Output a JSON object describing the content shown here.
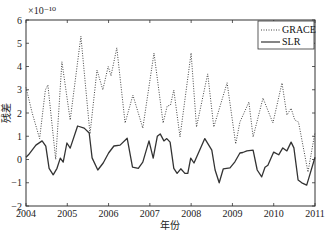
{
  "chart_data": {
    "type": "line",
    "title": "",
    "xlabel": "年份",
    "ylabel": "残差",
    "y_multiplier": "×10⁻¹⁰",
    "xlim": [
      2004,
      2011
    ],
    "ylim": [
      -2,
      6
    ],
    "x_ticks": [
      "2004",
      "2005",
      "2006",
      "2007",
      "2008",
      "2009",
      "2010",
      "2011"
    ],
    "y_ticks": [
      "-2",
      "-1",
      "0",
      "1",
      "2",
      "3",
      "4",
      "5",
      "6"
    ],
    "grid": false,
    "legend_position": "upper right",
    "series": [
      {
        "name": "GRACE",
        "style": "dotted",
        "color": "#444444",
        "points": [
          [
            2004.0,
            3.1
          ],
          [
            2004.15,
            2.0
          ],
          [
            2004.33,
            0.9
          ],
          [
            2004.47,
            3.0
          ],
          [
            2004.53,
            3.2
          ],
          [
            2004.72,
            0.0
          ],
          [
            2004.87,
            4.2
          ],
          [
            2005.07,
            1.7
          ],
          [
            2005.33,
            5.3
          ],
          [
            2005.55,
            1.1
          ],
          [
            2005.72,
            3.85
          ],
          [
            2005.86,
            3.0
          ],
          [
            2005.99,
            4.0
          ],
          [
            2006.06,
            3.6
          ],
          [
            2006.2,
            4.8
          ],
          [
            2006.4,
            1.57
          ],
          [
            2006.59,
            2.77
          ],
          [
            2006.83,
            1.35
          ],
          [
            2007.1,
            4.58
          ],
          [
            2007.32,
            1.57
          ],
          [
            2007.42,
            2.3
          ],
          [
            2007.5,
            2.34
          ],
          [
            2007.58,
            2.99
          ],
          [
            2007.73,
            0.97
          ],
          [
            2008.0,
            4.58
          ],
          [
            2008.13,
            1.4
          ],
          [
            2008.4,
            3.68
          ],
          [
            2008.55,
            1.4
          ],
          [
            2008.87,
            3.3
          ],
          [
            2009.08,
            0.67
          ],
          [
            2009.18,
            1.61
          ],
          [
            2009.4,
            2.47
          ],
          [
            2009.5,
            0.97
          ],
          [
            2009.74,
            2.64
          ],
          [
            2009.98,
            1.57
          ],
          [
            2010.2,
            3.29
          ],
          [
            2010.32,
            1.91
          ],
          [
            2010.42,
            2.2
          ],
          [
            2010.51,
            1.7
          ],
          [
            2010.6,
            1.61
          ],
          [
            2010.83,
            -0.54
          ],
          [
            2011.0,
            1.18
          ]
        ]
      },
      {
        "name": "SLR",
        "style": "solid",
        "color": "#333333",
        "points": [
          [
            2004.0,
            0.1
          ],
          [
            2004.06,
            0.2
          ],
          [
            2004.24,
            0.62
          ],
          [
            2004.39,
            0.8
          ],
          [
            2004.48,
            0.57
          ],
          [
            2004.56,
            -0.38
          ],
          [
            2004.66,
            -0.66
          ],
          [
            2004.75,
            -0.38
          ],
          [
            2004.83,
            0.06
          ],
          [
            2004.9,
            -0.11
          ],
          [
            2004.99,
            0.71
          ],
          [
            2005.07,
            0.49
          ],
          [
            2005.25,
            1.44
          ],
          [
            2005.41,
            1.35
          ],
          [
            2005.53,
            1.14
          ],
          [
            2005.6,
            0.07
          ],
          [
            2005.74,
            -0.45
          ],
          [
            2005.87,
            -0.15
          ],
          [
            2006.0,
            0.28
          ],
          [
            2006.13,
            0.58
          ],
          [
            2006.28,
            0.62
          ],
          [
            2006.45,
            0.91
          ],
          [
            2006.58,
            -0.33
          ],
          [
            2006.72,
            -0.38
          ],
          [
            2006.83,
            -0.11
          ],
          [
            2006.98,
            0.8
          ],
          [
            2007.08,
            0.06
          ],
          [
            2007.18,
            1.0
          ],
          [
            2007.25,
            1.1
          ],
          [
            2007.34,
            0.8
          ],
          [
            2007.41,
            0.9
          ],
          [
            2007.49,
            0.75
          ],
          [
            2007.58,
            -0.38
          ],
          [
            2007.66,
            -0.6
          ],
          [
            2007.75,
            -0.4
          ],
          [
            2007.85,
            -0.6
          ],
          [
            2007.92,
            -0.6
          ],
          [
            2007.99,
            0.06
          ],
          [
            2008.07,
            -0.15
          ],
          [
            2008.33,
            0.9
          ],
          [
            2008.5,
            0.4
          ],
          [
            2008.58,
            -0.45
          ],
          [
            2008.68,
            -1.0
          ],
          [
            2008.78,
            -0.4
          ],
          [
            2008.94,
            -0.36
          ],
          [
            2009.06,
            -0.1
          ],
          [
            2009.18,
            0.28
          ],
          [
            2009.25,
            0.3
          ],
          [
            2009.35,
            0.37
          ],
          [
            2009.5,
            0.4
          ],
          [
            2009.6,
            -0.45
          ],
          [
            2009.71,
            -0.75
          ],
          [
            2009.79,
            -0.33
          ],
          [
            2009.86,
            -0.25
          ],
          [
            2010.0,
            0.32
          ],
          [
            2010.12,
            0.2
          ],
          [
            2010.22,
            0.5
          ],
          [
            2010.32,
            0.37
          ],
          [
            2010.42,
            0.75
          ],
          [
            2010.49,
            0.5
          ],
          [
            2010.59,
            -0.88
          ],
          [
            2010.68,
            -1.0
          ],
          [
            2010.8,
            -1.1
          ],
          [
            2010.85,
            -0.8
          ],
          [
            2011.0,
            0.1
          ]
        ]
      }
    ]
  },
  "legend": {
    "items": [
      {
        "label": "GRACE",
        "style": "dotted"
      },
      {
        "label": "SLR",
        "style": "solid"
      }
    ]
  },
  "axes": {
    "xlabel": "年份",
    "ylabel": "残差",
    "multiplier": "×10⁻¹⁰"
  },
  "caption": {
    "text": "图"
  }
}
